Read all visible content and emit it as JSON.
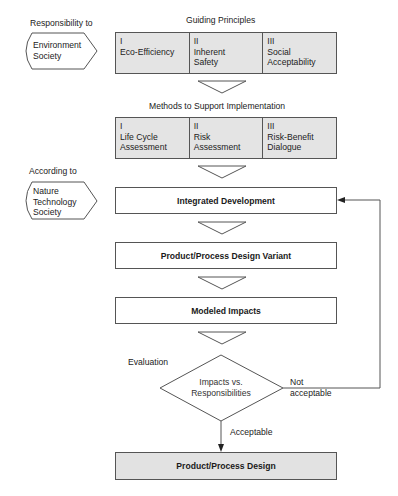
{
  "responsibility": {
    "label": "Responsibility to",
    "items": [
      "Environment",
      "Society"
    ]
  },
  "guiding_principles": {
    "title": "Guiding Principles",
    "cells": [
      {
        "numeral": "I",
        "line1": "Eco-Efficiency",
        "line2": ""
      },
      {
        "numeral": "II",
        "line1": "Inherent",
        "line2": "Safety"
      },
      {
        "numeral": "III",
        "line1": "Social",
        "line2": "Acceptability"
      }
    ]
  },
  "methods": {
    "title": "Methods to Support Implementation",
    "cells": [
      {
        "numeral": "I",
        "line1": "Life Cycle",
        "line2": "Assessment"
      },
      {
        "numeral": "II",
        "line1": "Risk",
        "line2": "Assessment"
      },
      {
        "numeral": "III",
        "line1": "Risk-Benefit",
        "line2": "Dialogue"
      }
    ]
  },
  "according": {
    "label": "According to",
    "items": [
      "Nature",
      "Technology",
      "Society"
    ]
  },
  "steps": {
    "integrated_development": "Integrated Development",
    "design_variant": "Product/Process Design Variant",
    "modeled_impacts": "Modeled Impacts",
    "final_design": "Product/Process Design"
  },
  "evaluation": {
    "label": "Evaluation",
    "decision_line1": "Impacts vs.",
    "decision_line2": "Responsibilities",
    "not_acceptable_line1": "Not",
    "not_acceptable_line2": "acceptable",
    "acceptable": "Acceptable"
  }
}
